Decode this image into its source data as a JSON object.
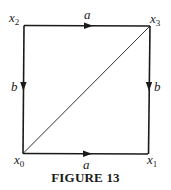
{
  "figure": {
    "caption": "FIGURE 13"
  },
  "vertices": [
    {
      "id": "x0",
      "base": "x",
      "sub": "0",
      "pos": "bottom-left"
    },
    {
      "id": "x1",
      "base": "x",
      "sub": "1",
      "pos": "bottom-right"
    },
    {
      "id": "x2",
      "base": "x",
      "sub": "2",
      "pos": "top-left"
    },
    {
      "id": "x3",
      "base": "x",
      "sub": "3",
      "pos": "top-right"
    }
  ],
  "edges": [
    {
      "from": "x2",
      "to": "x3",
      "label": "a",
      "direction": "right"
    },
    {
      "from": "x0",
      "to": "x1",
      "label": "a",
      "direction": "right"
    },
    {
      "from": "x2",
      "to": "x0",
      "label": "b",
      "direction": "down"
    },
    {
      "from": "x3",
      "to": "x1",
      "label": "b",
      "direction": "down"
    },
    {
      "from": "x0",
      "to": "x3",
      "label": "",
      "direction": "none"
    }
  ],
  "labels": {
    "top_edge": "a",
    "bottom_edge": "a",
    "left_edge": "b",
    "right_edge": "b"
  },
  "colors": {
    "ink": "#1a1a1a",
    "background": "#ffffff"
  }
}
